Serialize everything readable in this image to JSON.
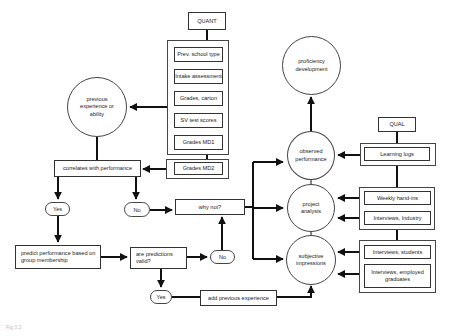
{
  "diagram": {
    "quant_label": "QUANT",
    "qual_label": "QUAL",
    "quant_sources": [
      "Prev. school type",
      "Intake assessment",
      "Grades, carton",
      "SV test scores",
      "Grades MD1"
    ],
    "quant_extra": "Grades MD2",
    "qual_sources": {
      "observed": [
        "Learning logs"
      ],
      "project": [
        "Weekly hand-ins",
        "Interviews, Industry"
      ],
      "subjective": [
        "Interviews, students",
        "Interviews, employed graduates"
      ]
    },
    "nodes": {
      "previous_experience": "previous experience or ability",
      "correlates": "correlates with performance",
      "yes1": "Yes",
      "no1": "No",
      "why_not": "why not?",
      "predict": "predict performance based on group membership",
      "are_predictions_valid": "are predictions valid?",
      "no2": "No",
      "yes2": "Yes",
      "add_previous_experience": "add previous experience",
      "proficiency_development": "proficiency development",
      "observed_performance": "observed performance",
      "project_analysis": "project analysis",
      "subjective_impressions": "subjective impressions"
    },
    "caption": "Fig 3.2"
  },
  "colors": {
    "line": "#111111",
    "border": "#444444",
    "background": "#ffffff"
  }
}
